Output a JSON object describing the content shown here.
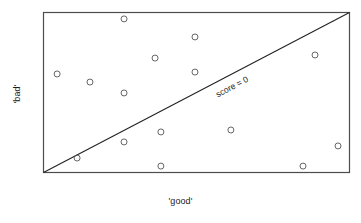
{
  "chart_data": {
    "type": "scatter",
    "title": "",
    "xlabel": "'good'",
    "ylabel": "'bad'",
    "xlim": [
      0,
      1
    ],
    "ylim": [
      0,
      1
    ],
    "grid": false,
    "legend": null,
    "marker": {
      "shape": "open-circle",
      "radius_px": 3,
      "edge_color": "#555555",
      "fill": "none"
    },
    "annotations": [
      {
        "name": "score-zero-line-label",
        "text": "score = 0",
        "x": 0.62,
        "y": 0.52,
        "rotation_deg": -27.7
      }
    ],
    "reference_line": {
      "name": "score-zero-line",
      "label": "score = 0",
      "from": [
        0.0,
        0.0
      ],
      "to": [
        1.0,
        1.0
      ],
      "color": "#222222",
      "width_px": 1.1
    },
    "points": [
      {
        "x": 0.264,
        "y": 0.957
      },
      {
        "x": 0.495,
        "y": 0.845
      },
      {
        "x": 0.365,
        "y": 0.714
      },
      {
        "x": 0.046,
        "y": 0.615
      },
      {
        "x": 0.153,
        "y": 0.565
      },
      {
        "x": 0.495,
        "y": 0.627
      },
      {
        "x": 0.264,
        "y": 0.497
      },
      {
        "x": 0.886,
        "y": 0.733
      },
      {
        "x": 0.384,
        "y": 0.255
      },
      {
        "x": 0.264,
        "y": 0.193
      },
      {
        "x": 0.612,
        "y": 0.267
      },
      {
        "x": 0.111,
        "y": 0.093
      },
      {
        "x": 0.384,
        "y": 0.043
      },
      {
        "x": 0.847,
        "y": 0.043
      },
      {
        "x": 0.961,
        "y": 0.168
      }
    ]
  },
  "figure": {
    "frame_color": "#4d4d4d",
    "background": "#ffffff",
    "plot_box_px": {
      "left": 43,
      "top": 12,
      "right": 350,
      "bottom": 173
    }
  }
}
